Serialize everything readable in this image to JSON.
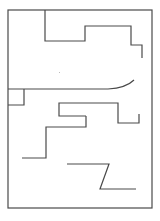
{
  "diagram": {
    "type": "floor-plan-walls",
    "width": 160,
    "height": 221,
    "background": "#ffffff",
    "stroke": "#4a4a4a",
    "stroke_width": 1.2,
    "outer_border": {
      "x": 8,
      "y": 10,
      "width": 144,
      "height": 198
    },
    "walls": [
      {
        "name": "top-step-wall",
        "points": [
          [
            45,
            10
          ],
          [
            45,
            41
          ],
          [
            85,
            41
          ],
          [
            85,
            26
          ],
          [
            131,
            26
          ],
          [
            131,
            45
          ],
          [
            142,
            45
          ],
          [
            142,
            58
          ]
        ]
      },
      {
        "name": "small-corner-box",
        "points": [
          [
            8,
            105
          ],
          [
            24,
            105
          ],
          [
            24,
            89
          ]
        ]
      },
      {
        "name": "middle-step-wall",
        "points": [
          [
            86,
            116
          ],
          [
            59,
            116
          ],
          [
            59,
            103
          ],
          [
            118,
            103
          ],
          [
            118,
            123
          ],
          [
            139,
            123
          ],
          [
            139,
            114
          ]
        ]
      },
      {
        "name": "lower-step-wall",
        "points": [
          [
            86,
            116
          ],
          [
            86,
            127
          ],
          [
            46,
            127
          ],
          [
            46,
            158
          ],
          [
            22,
            158
          ]
        ]
      },
      {
        "name": "z-wall",
        "points": [
          [
            67,
            164
          ],
          [
            109,
            164
          ],
          [
            100,
            189
          ],
          [
            136,
            189
          ]
        ]
      }
    ],
    "curved_walls": [
      {
        "name": "curved-corridor-wall",
        "d": "M8,89 L108,89 Q126,88 134,80"
      }
    ],
    "specks": [
      {
        "name": "speck",
        "x": 59,
        "y": 72
      }
    ]
  }
}
